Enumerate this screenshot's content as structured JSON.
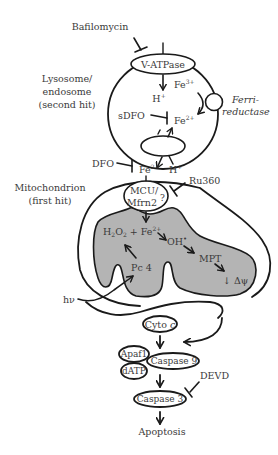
{
  "diagram": {
    "colors": {
      "stroke": "#1a1a1a",
      "text": "#3a3a3a",
      "matrix_fill": "#b4b4b4",
      "background": "#ffffff"
    },
    "inhibitors": {
      "bafilomycin": "Bafilomycin",
      "sdfo": "sDFO",
      "dfo": "DFO",
      "ru360": "Ru360",
      "devd": "DEVD"
    },
    "lysosome": {
      "label_line1": "Lysosome/",
      "label_line2": "endosome",
      "label_line3": "(second hit)",
      "v_atpase": "V-ATPase",
      "fe3": "Fe",
      "fe3_sup": "3+",
      "h_plus": "H",
      "h_plus_sup": "+",
      "fe2": "Fe",
      "fe2_sup": "2+",
      "ferri_line1": "Ferri-",
      "ferri_line2": "reductase"
    },
    "cytosol": {
      "fe2": "Fe",
      "fe2_sup": "2+",
      "h_plus": "H",
      "h_plus_sup": "+"
    },
    "mitochondrion": {
      "label_line1": "Mitochondrion",
      "label_line2": "(first hit)",
      "mcu_line1": "MCU/",
      "mcu_line2": "Mfrn2",
      "mcu_q": "?",
      "h2o2": "H",
      "h2o2_sub1": "2",
      "h2o2_o": "O",
      "h2o2_sub2": "2",
      "plus_fe": " + Fe",
      "fe_sup": "2+",
      "oh": "OH",
      "oh_sup": "•",
      "mpt": "MPT",
      "delta_psi": "↓ Δψ",
      "pc4": "Pc 4",
      "hv": "hν"
    },
    "apoptosis_pathway": {
      "cyto_c": "Cyto ",
      "cyto_c_italic": "c",
      "apaf1": "Apaf1",
      "datp": "dATP",
      "caspase9": "Caspase 9",
      "caspase3": "Caspase 3",
      "apoptosis": "Apoptosis"
    }
  }
}
